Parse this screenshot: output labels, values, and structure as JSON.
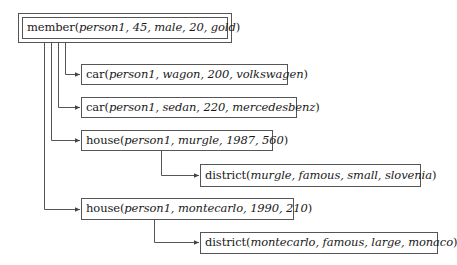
{
  "diagram": {
    "root": {
      "predicate": "member",
      "args": "person1, 45, male, 20, gold"
    },
    "nodes": [
      {
        "id": "car1",
        "predicate": "car",
        "args": "person1, wagon, 200, volkswagen"
      },
      {
        "id": "car2",
        "predicate": "car",
        "args": "person1, sedan, 220, mercedesbenz"
      },
      {
        "id": "house1",
        "predicate": "house",
        "args": "person1, murgle, 1987, 560"
      },
      {
        "id": "district1",
        "predicate": "district",
        "args": "murgle, famous, small, slovenia"
      },
      {
        "id": "house2",
        "predicate": "house",
        "args": "person1, montecarlo, 1990, 210"
      },
      {
        "id": "district2",
        "predicate": "district",
        "args": "montecarlo, famous, large, monaco"
      }
    ],
    "edges": [
      {
        "from": "member",
        "to": "car1"
      },
      {
        "from": "member",
        "to": "car2"
      },
      {
        "from": "member",
        "to": "house1"
      },
      {
        "from": "house1",
        "to": "district1"
      },
      {
        "from": "member",
        "to": "house2"
      },
      {
        "from": "house2",
        "to": "district2"
      }
    ],
    "colors": {
      "line": "#555555",
      "text": "#1a1a1a",
      "background": "#ffffff"
    }
  }
}
